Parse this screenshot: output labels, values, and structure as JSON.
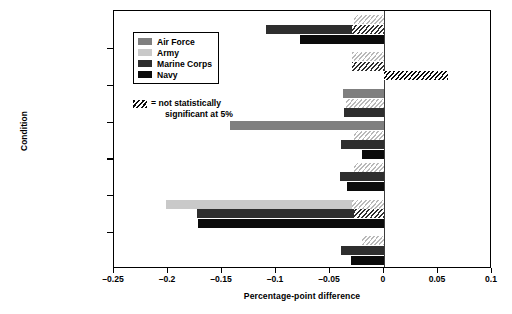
{
  "chart_data": {
    "type": "bar",
    "orientation": "horizontal",
    "title": "",
    "xlabel": "Percentage-point difference",
    "ylabel": "Condition",
    "xlim": [
      -0.25,
      0.1
    ],
    "xticks": [
      -0.25,
      -0.2,
      -0.15,
      -0.1,
      -0.05,
      0,
      0.05,
      0.1
    ],
    "xtick_labels": [
      "–0.25",
      "–0.2",
      "–0.15",
      "–0.1",
      "–0.05",
      "0",
      "0.05",
      "0.1"
    ],
    "grid": false,
    "zero_reference_line": true,
    "legend_position": "upper-left-inside",
    "categories": [
      "Abdominal: loosened 2004",
      "Asthma: tightened 2004",
      "Abdominal: tightened 2005",
      "Knee: tightened 2005",
      "Hearing: tightened 2005",
      "Skin and cellular: tightened 2005",
      "Endocrine: tightened 2005"
    ],
    "category_lines": [
      [
        "Abdominal:",
        "loosened 2004"
      ],
      [
        "Asthma:",
        "tightened 2004"
      ],
      [
        "Abdominal:",
        "tightened 2005"
      ],
      [
        "Knee:",
        "tightened 2005"
      ],
      [
        "Hearing:",
        "tightened 2005"
      ],
      [
        "Skin and cellular:",
        "tightened 2005"
      ],
      [
        "Endocrine:",
        "tightened 2005"
      ]
    ],
    "series": [
      {
        "name": "Air Force",
        "color": "#7f7f7f",
        "values": [
          null,
          null,
          -0.038,
          -0.143,
          null,
          null,
          null
        ]
      },
      {
        "name": "Army",
        "color": "#c9c9c9",
        "values": [
          -0.028,
          -0.03,
          -0.035,
          -0.028,
          -0.028,
          -0.202,
          -0.02
        ]
      },
      {
        "name": "Marine Corps",
        "color": "#2e2e2e",
        "values": [
          -0.109,
          -0.03,
          -0.037,
          -0.04,
          -0.041,
          -0.173,
          -0.04
        ]
      },
      {
        "name": "Navy",
        "color": "#0b0b0b",
        "values": [
          -0.078,
          0.059,
          null,
          -0.02,
          -0.034,
          -0.172,
          -0.031
        ]
      }
    ],
    "not_significant_note": "= not statistically significant at 5%",
    "not_significant_note_lines": [
      "= not statistically",
      "significant at 5%"
    ],
    "bars": [
      {
        "category_index": 0,
        "series": "Army",
        "value": -0.028,
        "significant": false,
        "hatch_from": -0.028
      },
      {
        "category_index": 0,
        "series": "Marine Corps",
        "value": -0.109,
        "significant": true,
        "hatch_from": -0.03
      },
      {
        "category_index": 0,
        "series": "Navy",
        "value": -0.078,
        "significant": true,
        "hatch_from": null
      },
      {
        "category_index": 1,
        "series": "Army",
        "value": -0.03,
        "significant": false,
        "hatch_from": -0.03
      },
      {
        "category_index": 1,
        "series": "Marine Corps",
        "value": -0.03,
        "significant": false,
        "hatch_from": -0.03
      },
      {
        "category_index": 1,
        "series": "Navy",
        "value": 0.059,
        "significant": false,
        "hatch_from": 0.059
      },
      {
        "category_index": 2,
        "series": "Air Force",
        "value": -0.038,
        "significant": true,
        "hatch_from": null
      },
      {
        "category_index": 2,
        "series": "Army",
        "value": -0.035,
        "significant": false,
        "hatch_from": -0.035
      },
      {
        "category_index": 2,
        "series": "Marine Corps",
        "value": -0.037,
        "significant": true,
        "hatch_from": null
      },
      {
        "category_index": 3,
        "series": "Air Force",
        "value": -0.143,
        "significant": true,
        "hatch_from": null
      },
      {
        "category_index": 3,
        "series": "Army",
        "value": -0.028,
        "significant": false,
        "hatch_from": -0.028
      },
      {
        "category_index": 3,
        "series": "Marine Corps",
        "value": -0.04,
        "significant": true,
        "hatch_from": null
      },
      {
        "category_index": 3,
        "series": "Navy",
        "value": -0.02,
        "significant": true,
        "hatch_from": null
      },
      {
        "category_index": 4,
        "series": "Army",
        "value": -0.028,
        "significant": false,
        "hatch_from": -0.028
      },
      {
        "category_index": 4,
        "series": "Marine Corps",
        "value": -0.041,
        "significant": true,
        "hatch_from": null
      },
      {
        "category_index": 4,
        "series": "Navy",
        "value": -0.034,
        "significant": true,
        "hatch_from": null
      },
      {
        "category_index": 5,
        "series": "Army",
        "value": -0.202,
        "significant": true,
        "hatch_from": -0.03
      },
      {
        "category_index": 5,
        "series": "Marine Corps",
        "value": -0.173,
        "significant": true,
        "hatch_from": -0.028
      },
      {
        "category_index": 5,
        "series": "Navy",
        "value": -0.172,
        "significant": true,
        "hatch_from": null
      },
      {
        "category_index": 6,
        "series": "Army",
        "value": -0.02,
        "significant": false,
        "hatch_from": -0.02
      },
      {
        "category_index": 6,
        "series": "Marine Corps",
        "value": -0.04,
        "significant": true,
        "hatch_from": null
      },
      {
        "category_index": 6,
        "series": "Navy",
        "value": -0.031,
        "significant": true,
        "hatch_from": null
      }
    ]
  },
  "legend": {
    "items": [
      {
        "label": "Air Force",
        "color": "#7f7f7f"
      },
      {
        "label": "Army",
        "color": "#c9c9c9"
      },
      {
        "label": "Marine Corps",
        "color": "#2e2e2e"
      },
      {
        "label": "Navy",
        "color": "#0b0b0b"
      }
    ]
  },
  "axes": {
    "x_title": "Percentage-point difference",
    "y_title": "Condition"
  }
}
